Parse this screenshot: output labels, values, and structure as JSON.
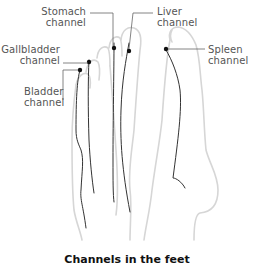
{
  "labels": {
    "stomach": {
      "line1": "Stomach",
      "line2": "channel"
    },
    "liver": {
      "line1": "Liver",
      "line2": "channel"
    },
    "gallbladder": {
      "line1": "Gallbladder",
      "line2": "channel"
    },
    "bladder": {
      "line1": "Bladder",
      "line2": "channel"
    },
    "spleen": {
      "line1": "Spleen",
      "line2": "channel"
    }
  },
  "caption": "Channels in the feet",
  "colors": {
    "outline": "#d6d6d6",
    "channel_line": "#333333",
    "leader_line": "#666666",
    "label_text": "#555555"
  }
}
